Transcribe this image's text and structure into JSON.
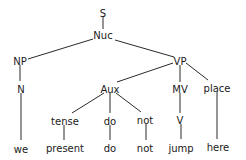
{
  "diagram": {
    "type": "syntax-tree",
    "nodes": [
      {
        "id": "S",
        "label": "S",
        "x": 103,
        "y": 13
      },
      {
        "id": "Nuc",
        "label": "Nuc",
        "x": 103,
        "y": 35
      },
      {
        "id": "NP",
        "label": "NP",
        "x": 20,
        "y": 61
      },
      {
        "id": "VP",
        "label": "VP",
        "x": 180,
        "y": 61
      },
      {
        "id": "N",
        "label": "N",
        "x": 21,
        "y": 89
      },
      {
        "id": "Aux",
        "label": "Aux",
        "x": 110,
        "y": 89
      },
      {
        "id": "MV",
        "label": "MV",
        "x": 180,
        "y": 89
      },
      {
        "id": "place",
        "label": "place",
        "x": 217,
        "y": 88
      },
      {
        "id": "tense",
        "label": "tense",
        "x": 65,
        "y": 121
      },
      {
        "id": "do1",
        "label": "do",
        "x": 110,
        "y": 121
      },
      {
        "id": "not1",
        "label": "not",
        "x": 145,
        "y": 120
      },
      {
        "id": "V",
        "label": "V",
        "x": 180,
        "y": 120
      },
      {
        "id": "we",
        "label": "we",
        "x": 21,
        "y": 149
      },
      {
        "id": "present",
        "label": "present",
        "x": 65,
        "y": 148
      },
      {
        "id": "do2",
        "label": "do",
        "x": 110,
        "y": 148
      },
      {
        "id": "not2",
        "label": "not",
        "x": 145,
        "y": 148
      },
      {
        "id": "jump",
        "label": "jump",
        "x": 181,
        "y": 148
      },
      {
        "id": "here",
        "label": "here",
        "x": 218,
        "y": 147
      }
    ],
    "edges": [
      {
        "from": "S",
        "to": "Nuc",
        "x1": 103,
        "y1": 16,
        "x2": 103,
        "y2": 29
      },
      {
        "from": "Nuc",
        "to": "NP",
        "x1": 93,
        "y1": 39,
        "x2": 28,
        "y2": 59
      },
      {
        "from": "Nuc",
        "to": "VP",
        "x1": 115,
        "y1": 40,
        "x2": 174,
        "y2": 57
      },
      {
        "from": "NP",
        "to": "N",
        "x1": 20,
        "y1": 65,
        "x2": 20,
        "y2": 81
      },
      {
        "from": "N",
        "to": "we",
        "x1": 21,
        "y1": 93,
        "x2": 21,
        "y2": 140
      },
      {
        "from": "VP",
        "to": "Aux",
        "x1": 173,
        "y1": 63,
        "x2": 117,
        "y2": 82
      },
      {
        "from": "VP",
        "to": "MV",
        "x1": 180,
        "y1": 65,
        "x2": 180,
        "y2": 82
      },
      {
        "from": "VP",
        "to": "place",
        "x1": 186,
        "y1": 63,
        "x2": 208,
        "y2": 80
      },
      {
        "from": "Aux",
        "to": "tense",
        "x1": 104,
        "y1": 93,
        "x2": 72,
        "y2": 113
      },
      {
        "from": "Aux",
        "to": "do1",
        "x1": 110,
        "y1": 93,
        "x2": 110,
        "y2": 113
      },
      {
        "from": "Aux",
        "to": "not1",
        "x1": 116,
        "y1": 93,
        "x2": 141,
        "y2": 112
      },
      {
        "from": "MV",
        "to": "V",
        "x1": 180,
        "y1": 93,
        "x2": 180,
        "y2": 113
      },
      {
        "from": "place",
        "to": "here",
        "x1": 217,
        "y1": 92,
        "x2": 217,
        "y2": 139
      },
      {
        "from": "tense",
        "to": "present",
        "x1": 64,
        "y1": 125,
        "x2": 64,
        "y2": 140
      },
      {
        "from": "do1",
        "to": "do2",
        "x1": 110,
        "y1": 125,
        "x2": 110,
        "y2": 140
      },
      {
        "from": "not1",
        "to": "not2",
        "x1": 146,
        "y1": 124,
        "x2": 146,
        "y2": 140
      },
      {
        "from": "V",
        "to": "jump",
        "x1": 181,
        "y1": 124,
        "x2": 181,
        "y2": 139
      }
    ]
  },
  "colors": {
    "background": "#ffffff",
    "line": "#2a2a2a",
    "text": "#1a1a1a"
  }
}
